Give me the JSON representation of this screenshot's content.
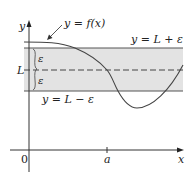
{
  "diagram": {
    "labels": {
      "function": "y = f(x)",
      "upper": "y = L + ε",
      "lower": "y = L − ε",
      "L": "L",
      "epsilon_top": "ε",
      "epsilon_bottom": "ε",
      "y_axis": "y",
      "x_axis": "x",
      "origin": "0",
      "a": "a"
    },
    "colors": {
      "band_fill": "#e3e3e3",
      "band_lines": "#555555",
      "curve": "#444444",
      "axes": "#333333"
    }
  }
}
